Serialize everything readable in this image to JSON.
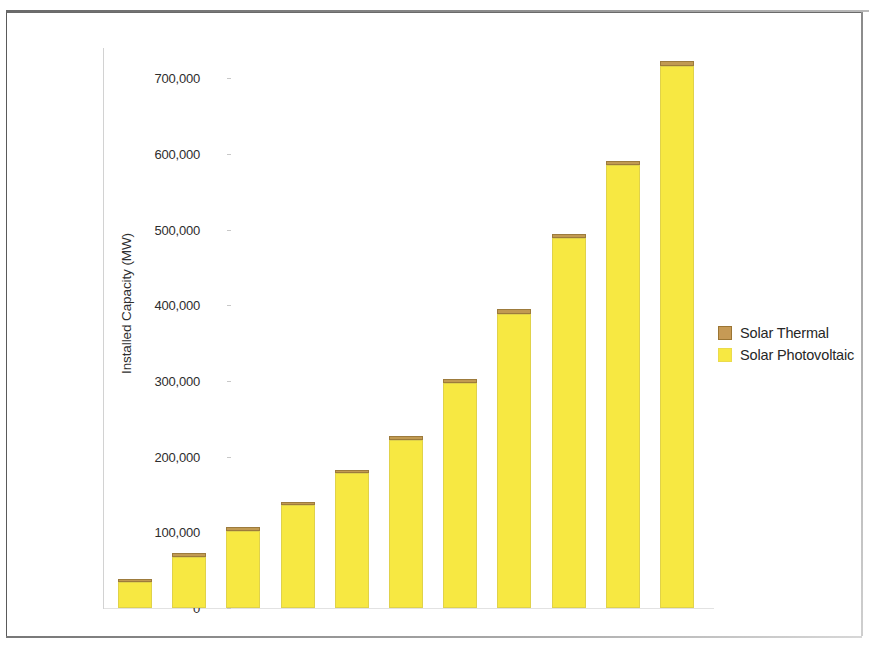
{
  "chart_data": {
    "type": "bar",
    "title": "",
    "subtitle": "",
    "xlabel": "",
    "ylabel": "Installed Capacity (MW)",
    "categories": [
      "2010",
      "2011",
      "2012",
      "2013",
      "2014",
      "2015",
      "2016",
      "2017",
      "2018",
      "2019",
      "2020"
    ],
    "series": [
      {
        "name": "Solar Photovoltaic",
        "color": "#f7e842",
        "values": [
          34000,
          68000,
          102000,
          136000,
          178000,
          222000,
          297000,
          389000,
          489000,
          585000,
          716000
        ]
      },
      {
        "name": "Solar Thermal",
        "color": "#c19a52",
        "values": [
          2000,
          2500,
          3000,
          3500,
          4500,
          5000,
          5000,
          5500,
          5500,
          6000,
          6500
        ]
      }
    ],
    "stacked": true,
    "totals": [
      36000,
      70500,
      105000,
      139500,
      182500,
      227000,
      302000,
      394500,
      494500,
      591000,
      722500
    ],
    "ylim": [
      0,
      740000
    ],
    "ytick_values": [
      0,
      100000,
      200000,
      300000,
      400000,
      500000,
      600000,
      700000
    ],
    "ytick_labels": [
      "0",
      "100,000",
      "200,000",
      "300,000",
      "400,000",
      "500,000",
      "600,000",
      "700,000"
    ],
    "grid": false,
    "legend_position": "right",
    "legend": [
      "Solar Thermal",
      "Solar Photovoltaic"
    ]
  },
  "axes": {
    "y_title": "Installed Capacity (MW)"
  },
  "legend": {
    "items": [
      {
        "label": "Solar Thermal",
        "swatch": "thermal-swatch",
        "color": "#c19a52"
      },
      {
        "label": "Solar Photovoltaic",
        "swatch": "pv-swatch",
        "color": "#f7e842"
      }
    ]
  }
}
